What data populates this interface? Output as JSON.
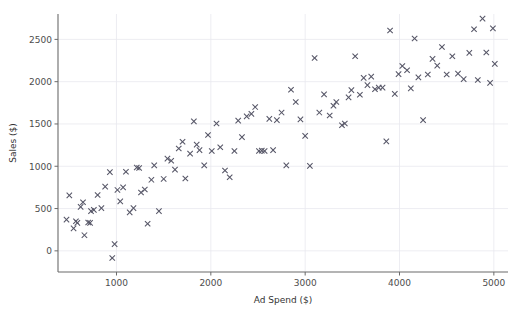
{
  "chart_data": {
    "type": "scatter",
    "title": "",
    "xlabel": "Ad Spend ($)",
    "ylabel": "Sales ($)",
    "xlim": [
      380,
      5150
    ],
    "ylim": [
      -250,
      2800
    ],
    "xticks": [
      1000,
      2000,
      3000,
      4000,
      5000
    ],
    "xtick_labels": [
      "1000",
      "2000",
      "3000",
      "4000",
      "5000"
    ],
    "yticks": [
      0,
      500,
      1000,
      1500,
      2000,
      2500
    ],
    "ytick_labels": [
      "0",
      "500",
      "1000",
      "1500",
      "2000",
      "2500"
    ],
    "grid": true,
    "legend": null,
    "marker": "x",
    "marker_color": "#555566",
    "grid_color": "#e9e9ef",
    "background": "#ffffff",
    "series": [
      {
        "name": "observations",
        "points": [
          [
            470,
            370
          ],
          [
            500,
            655
          ],
          [
            545,
            265
          ],
          [
            570,
            350
          ],
          [
            585,
            330
          ],
          [
            620,
            520
          ],
          [
            645,
            575
          ],
          [
            660,
            185
          ],
          [
            700,
            335
          ],
          [
            720,
            330
          ],
          [
            730,
            470
          ],
          [
            760,
            485
          ],
          [
            800,
            660
          ],
          [
            840,
            505
          ],
          [
            880,
            760
          ],
          [
            930,
            930
          ],
          [
            955,
            -85
          ],
          [
            980,
            80
          ],
          [
            1010,
            720
          ],
          [
            1040,
            585
          ],
          [
            1070,
            750
          ],
          [
            1100,
            935
          ],
          [
            1140,
            455
          ],
          [
            1180,
            505
          ],
          [
            1215,
            985
          ],
          [
            1240,
            980
          ],
          [
            1260,
            690
          ],
          [
            1300,
            725
          ],
          [
            1330,
            320
          ],
          [
            1370,
            840
          ],
          [
            1400,
            1010
          ],
          [
            1450,
            470
          ],
          [
            1500,
            850
          ],
          [
            1540,
            1090
          ],
          [
            1580,
            1065
          ],
          [
            1620,
            960
          ],
          [
            1660,
            1210
          ],
          [
            1700,
            1290
          ],
          [
            1730,
            855
          ],
          [
            1780,
            1150
          ],
          [
            1820,
            1530
          ],
          [
            1850,
            1255
          ],
          [
            1880,
            1190
          ],
          [
            1930,
            1010
          ],
          [
            1970,
            1370
          ],
          [
            2010,
            1180
          ],
          [
            2060,
            1505
          ],
          [
            2100,
            1225
          ],
          [
            2150,
            950
          ],
          [
            2200,
            870
          ],
          [
            2250,
            1180
          ],
          [
            2290,
            1540
          ],
          [
            2330,
            1345
          ],
          [
            2380,
            1590
          ],
          [
            2430,
            1620
          ],
          [
            2470,
            1700
          ],
          [
            2510,
            1180
          ],
          [
            2540,
            1185
          ],
          [
            2570,
            1180
          ],
          [
            2620,
            1560
          ],
          [
            2660,
            1190
          ],
          [
            2700,
            1545
          ],
          [
            2750,
            1635
          ],
          [
            2800,
            1010
          ],
          [
            2850,
            1905
          ],
          [
            2900,
            1760
          ],
          [
            2950,
            1555
          ],
          [
            3000,
            1360
          ],
          [
            3050,
            1005
          ],
          [
            3100,
            2280
          ],
          [
            3150,
            1635
          ],
          [
            3200,
            1850
          ],
          [
            3260,
            1600
          ],
          [
            3300,
            1715
          ],
          [
            3330,
            1760
          ],
          [
            3390,
            1485
          ],
          [
            3420,
            1505
          ],
          [
            3460,
            1815
          ],
          [
            3490,
            1900
          ],
          [
            3530,
            2300
          ],
          [
            3580,
            1845
          ],
          [
            3620,
            2045
          ],
          [
            3660,
            1960
          ],
          [
            3700,
            2060
          ],
          [
            3740,
            1910
          ],
          [
            3780,
            1930
          ],
          [
            3820,
            1930
          ],
          [
            3860,
            1295
          ],
          [
            3900,
            2605
          ],
          [
            3950,
            1855
          ],
          [
            3990,
            2090
          ],
          [
            4030,
            2185
          ],
          [
            4080,
            2135
          ],
          [
            4120,
            1920
          ],
          [
            4160,
            2510
          ],
          [
            4200,
            2050
          ],
          [
            4250,
            1545
          ],
          [
            4300,
            2085
          ],
          [
            4350,
            2270
          ],
          [
            4400,
            2190
          ],
          [
            4450,
            2410
          ],
          [
            4500,
            2085
          ],
          [
            4560,
            2300
          ],
          [
            4620,
            2095
          ],
          [
            4680,
            2030
          ],
          [
            4740,
            2340
          ],
          [
            4790,
            2620
          ],
          [
            4830,
            2020
          ],
          [
            4880,
            2745
          ],
          [
            4920,
            2345
          ],
          [
            4960,
            1985
          ],
          [
            4990,
            2630
          ],
          [
            5010,
            2210
          ]
        ]
      }
    ]
  }
}
